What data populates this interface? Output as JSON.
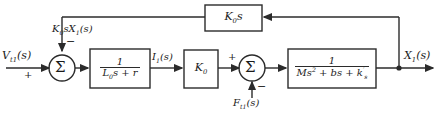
{
  "diagram": {
    "type": "control-system-block-diagram",
    "input": {
      "label_base": "V",
      "label_sub": "t1",
      "label_arg": "(s)",
      "sign": "+"
    },
    "output": {
      "label_base": "X",
      "label_sub": "1",
      "label_arg": "(s)"
    },
    "sum1": {
      "glyph": "Σ",
      "input_sign": "+",
      "feedback_sign": "−"
    },
    "sum2": {
      "glyph": "Σ",
      "input_sign": "+",
      "disturbance_sign": "−"
    },
    "block_electrical": {
      "numerator": "1",
      "denominator_base": "L",
      "denominator_sub": "0",
      "denominator_rest": "s + r"
    },
    "block_gain": {
      "label_base": "K",
      "label_sub": "0"
    },
    "block_mechanical": {
      "numerator": "1",
      "den_m": "Ms",
      "den_m_exp": "2",
      "den_b": " + bs + k",
      "den_k_prime": "′",
      "den_k_sub": "s"
    },
    "block_feedback": {
      "label_base": "K",
      "label_sub": "0",
      "label_rest": "s"
    },
    "signal_current": {
      "label_base": "I",
      "label_sub": "1",
      "label_arg": "(s)"
    },
    "signal_feedback": {
      "label_base": "K",
      "label_sub": "0",
      "label_mid": "sX",
      "label_sub2": "1",
      "label_arg": "(s)"
    },
    "signal_disturbance": {
      "label_base": "F",
      "label_sub": "t1",
      "label_arg": "(s)"
    },
    "colors": {
      "line": "#2b2b2b",
      "text": "#1b1b1b",
      "background": "#ffffff"
    }
  }
}
